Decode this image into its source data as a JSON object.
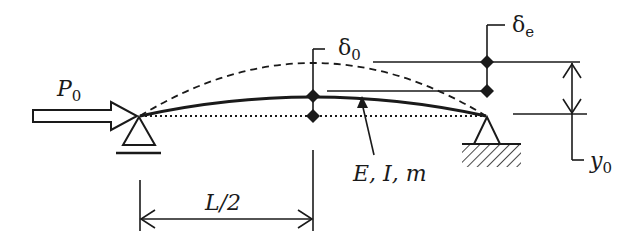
{
  "diagram": {
    "type": "beam-column with initial imperfection",
    "labels": {
      "load_main": "P",
      "load_sub": "0",
      "delta0_main": "δ",
      "delta0_sub": "0",
      "deltae_main": "δ",
      "deltae_sub": "e",
      "y0_main": "y",
      "y0_sub": "0",
      "props": "E, I, m",
      "half_span": "L/2"
    },
    "elements": [
      "axial load arrow P0",
      "pin support (left)",
      "roller/fixed support with hatching (right)",
      "dashed deflected shape",
      "solid initial curved member",
      "dotted chord line",
      "midspan deflection markers",
      "dimension arrows"
    ],
    "colors": {
      "ink": "#1a1a1a",
      "background": "#ffffff"
    }
  }
}
